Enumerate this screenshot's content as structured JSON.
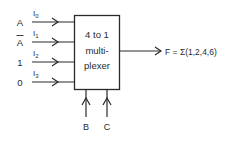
{
  "diagram": {
    "block": {
      "line1": "4 to 1",
      "line2": "multi-",
      "line3": "plexer"
    },
    "inputs": [
      {
        "source": "A",
        "pin": "I",
        "sub": "0"
      },
      {
        "source": "A",
        "overbar": true,
        "pin": "I",
        "sub": "1"
      },
      {
        "source": "1",
        "pin": "I",
        "sub": "2"
      },
      {
        "source": "0",
        "pin": "I",
        "sub": "3"
      }
    ],
    "selects": [
      {
        "label": "B"
      },
      {
        "label": "C"
      }
    ],
    "output": {
      "label": "F = Σ(1,2,4,6)"
    },
    "colors": {
      "stroke": "#2a2a2a",
      "background": "#ffffff"
    }
  }
}
